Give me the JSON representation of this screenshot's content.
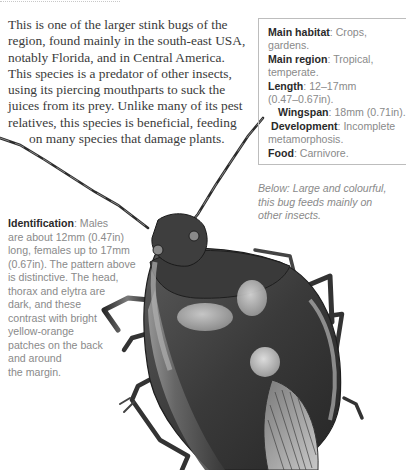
{
  "intro": {
    "lines": [
      "This is one of the larger stink bugs of the",
      "region, found mainly in the south-east USA,",
      "notably Florida, and in Central America.",
      "This species is a predator of other insects,",
      "using its piercing mouthparts to suck the",
      "juices from its prey. Unlike many of its pest",
      "relatives, this species is beneficial, feeding",
      "on many species that damage plants."
    ]
  },
  "infobox": {
    "habitat_label": "Main habitat",
    "habitat_value": ": Crops,",
    "habitat_value2": "gardens.",
    "region_label": "Main region",
    "region_value": ": Tropical,",
    "region_value2": "temperate.",
    "length_label": "Length",
    "length_value": ": 12–17mm",
    "length_value2": "(0.47–0.67in).",
    "wingspan_label": "Wingspan",
    "wingspan_value": ": 18mm (0.71in).",
    "development_label": "Development",
    "development_value": ": Incomplete",
    "development_value2": "metamorphosis.",
    "food_label": "Food",
    "food_value": ": Carnivore."
  },
  "caption": {
    "lines": [
      "Below: Large and colourful,",
      "this bug feeds mainly on",
      "other insects."
    ]
  },
  "identification": {
    "label": "Identification",
    "first": ": Males",
    "lines": [
      "are about 12mm (0.47in)",
      "long, females up to 17mm",
      "(0.67in). The pattern above",
      "is distinctive. The head,",
      "thorax and elytra are",
      "dark, and these",
      "contrast with bright",
      "yellow-orange",
      "patches on the back",
      "and around",
      "the margin."
    ]
  },
  "illustration": {
    "subject": "stink-bug-illustration",
    "colors": {
      "dark": "#2b2b2b",
      "mid": "#6e6e6e",
      "light": "#b9b9b9",
      "highlight": "#d6d6d6"
    }
  }
}
